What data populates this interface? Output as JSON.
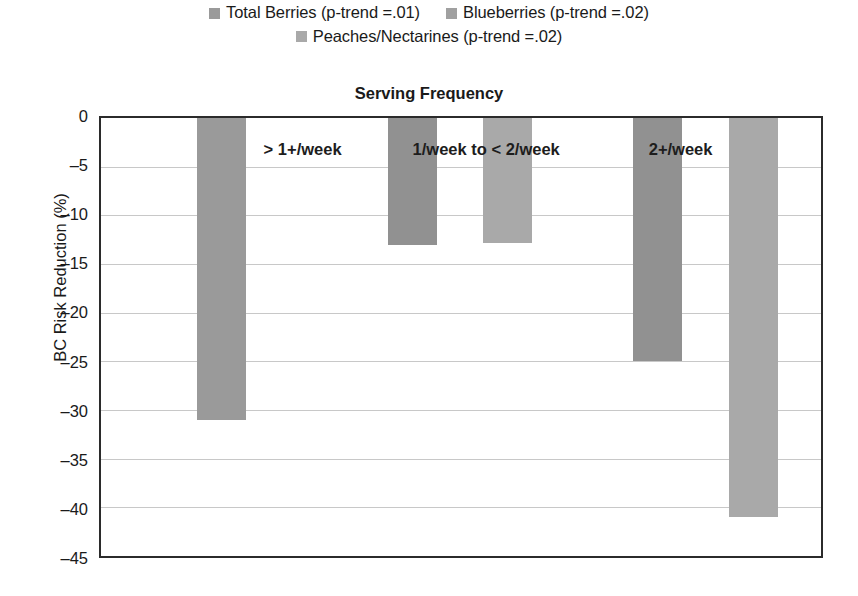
{
  "chart_data": {
    "type": "bar",
    "title": "Serving Frequency",
    "xlabel": "",
    "ylabel": "BC Risk Reduction (%)",
    "ylim": [
      -45,
      0
    ],
    "ytick_step": 5,
    "grid": true,
    "legend_position": "top",
    "categories": [
      "> 1+/week",
      "1/week to < 2/week",
      "2+/week"
    ],
    "series": [
      {
        "name": "Total Berries (p-trend =.01)",
        "short_name": "Total Berries",
        "color": "#9a9a9a",
        "values": [
          -31,
          null,
          null
        ]
      },
      {
        "name": "Blueberries (p-trend =.02)",
        "short_name": "Blueberries",
        "color": "#919191",
        "values": [
          null,
          -13,
          -25
        ]
      },
      {
        "name": "Peaches/Nectarines (p-trend =.02)",
        "short_name": "Peaches/Nectarines",
        "color": "#a9a9a9",
        "values": [
          null,
          -12.8,
          -41
        ]
      }
    ],
    "yticks": [
      "0",
      "–5",
      "–10",
      "–15",
      "–20",
      "–25",
      "–30",
      "–35",
      "–40",
      "–45"
    ],
    "ytick_values": [
      0,
      -5,
      -10,
      -15,
      -20,
      -25,
      -30,
      -35,
      -40,
      -45
    ],
    "bars": [
      {
        "label": "bar-total-berries-gt1week",
        "series": "Total Berries (p-trend =.01)",
        "category": "> 1+/week",
        "value": -31,
        "color": "#9a9a9a",
        "left_pct": 13.4,
        "width_pct": 6.8
      },
      {
        "label": "bar-blueberries-1to2week",
        "series": "Blueberries (p-trend =.02)",
        "category": "1/week to < 2/week",
        "value": -13,
        "color": "#919191",
        "left_pct": 39.8,
        "width_pct": 6.8
      },
      {
        "label": "bar-peaches-1to2week",
        "series": "Peaches/Nectarines (p-trend =.02)",
        "category": "1/week to < 2/week",
        "value": -12.8,
        "color": "#a9a9a9",
        "left_pct": 53.0,
        "width_pct": 6.8
      },
      {
        "label": "bar-blueberries-2week",
        "series": "Blueberries (p-trend =.02)",
        "category": "2+/week",
        "value": -25,
        "color": "#919191",
        "left_pct": 73.9,
        "width_pct": 6.8
      },
      {
        "label": "bar-peaches-2week",
        "series": "Peaches/Nectarines (p-trend =.02)",
        "category": "2+/week",
        "value": -41,
        "color": "#a9a9a9",
        "left_pct": 87.2,
        "width_pct": 6.8
      }
    ],
    "group_labels": [
      {
        "text": "> 1+/week",
        "center_pct": 28.0,
        "top_px": 22
      },
      {
        "text": "1/week to < 2/week",
        "center_pct": 53.5,
        "top_px": 22
      },
      {
        "text": "2+/week",
        "center_pct": 80.5,
        "top_px": 22
      }
    ]
  },
  "legend": {
    "row1": [
      {
        "label": "Total Berries (p-trend =.01)",
        "color": "#9a9a9a"
      },
      {
        "label": "Blueberries (p-trend =.02)",
        "color": "#a0a0a0"
      }
    ],
    "row2": [
      {
        "label": "Peaches/Nectarines (p-trend =.02)",
        "color": "#a9a9a9"
      }
    ]
  }
}
